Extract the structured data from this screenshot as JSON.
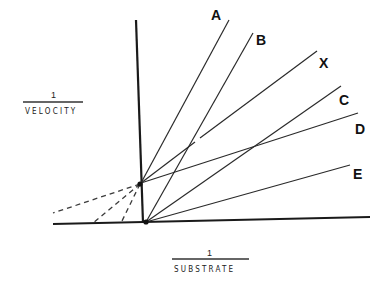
{
  "diagram": {
    "type": "Lineweaver-Burk double-reciprocal plot",
    "y_axis_label": {
      "numerator": "1",
      "denominator": "VELOCITY"
    },
    "x_axis_label": {
      "numerator": "1",
      "denominator": "SUBSTRATE"
    },
    "lines": [
      {
        "label": "A",
        "origin": "upper_intercept"
      },
      {
        "label": "B",
        "origin": "lower_intercept"
      },
      {
        "label": "X",
        "origin": "upper_intercept"
      },
      {
        "label": "C",
        "origin": "lower_intercept"
      },
      {
        "label": "D",
        "origin": "upper_intercept"
      },
      {
        "label": "E",
        "origin": "lower_intercept"
      }
    ],
    "extrapolations": [
      {
        "style": "dashed",
        "from": "upper_intercept",
        "note": "extends left to beyond x-axis start"
      },
      {
        "style": "dashed",
        "from": "upper_intercept",
        "note": "meets negative x-axis"
      },
      {
        "style": "dashed",
        "from": "upper_intercept",
        "note": "meets negative x-axis near origin"
      }
    ]
  }
}
